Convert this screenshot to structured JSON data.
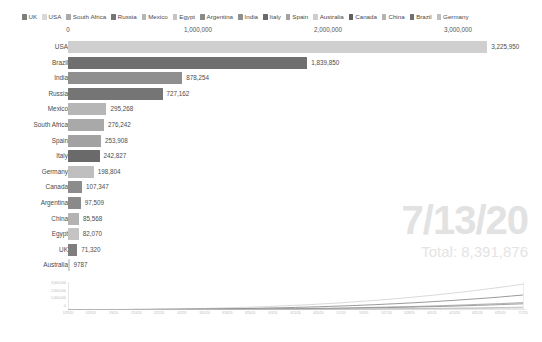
{
  "chart_data": {
    "type": "bar",
    "title": "",
    "subtitle": "",
    "xlabel": "",
    "ylabel": "",
    "orientation": "horizontal",
    "xlim": [
      0,
      3500000
    ],
    "grid": false,
    "axis_position": "top",
    "axis_ticks": [
      {
        "label": "0",
        "value": 0
      },
      {
        "label": "1,000,000",
        "value": 1000000
      },
      {
        "label": "2,000,000",
        "value": 2000000
      },
      {
        "label": "3,000,000",
        "value": 3000000
      }
    ],
    "categories": [
      "USA",
      "Brazil",
      "India",
      "Russia",
      "Mexico",
      "South Africa",
      "Spain",
      "Italy",
      "Germany",
      "Canada",
      "Argentina",
      "China",
      "Egypt",
      "UK",
      "Australia"
    ],
    "values": [
      3225950,
      1839850,
      878254,
      727162,
      295268,
      276242,
      253908,
      242827,
      198804,
      107347,
      97509,
      85568,
      82070,
      71320,
      9787
    ],
    "value_labels": [
      "3,225,950",
      "1,839,850",
      "878,254",
      "727,162",
      "295,268",
      "276,242",
      "253,908",
      "242,827",
      "198,804",
      "107,347",
      "97,509",
      "85,568",
      "82,070",
      "71,320",
      "9787"
    ],
    "bar_colors": [
      "#cfcfcf",
      "#6f6f6f",
      "#8f8f8f",
      "#757575",
      "#b6b6b6",
      "#a9a9a9",
      "#a2a2a2",
      "#6a6a6a",
      "#bfbfbf",
      "#8c8c8c",
      "#8a8a8a",
      "#b3b3b3",
      "#c4c4c4",
      "#7e7e7e",
      "#d2d2d2"
    ],
    "legend": {
      "position": "top",
      "entries": [
        {
          "label": "UK",
          "color": "#7e7e7e"
        },
        {
          "label": "USA",
          "color": "#d8d8d8"
        },
        {
          "label": "South Africa",
          "color": "#a9a9a9"
        },
        {
          "label": "Russia",
          "color": "#757575"
        },
        {
          "label": "Mexico",
          "color": "#b6b6b6"
        },
        {
          "label": "Egypt",
          "color": "#c4c4c4"
        },
        {
          "label": "Argentina",
          "color": "#8a8a8a"
        },
        {
          "label": "India",
          "color": "#8f8f8f"
        },
        {
          "label": "Italy",
          "color": "#6a6a6a"
        },
        {
          "label": "Spain",
          "color": "#a2a2a2"
        },
        {
          "label": "Australia",
          "color": "#cdcdcd"
        },
        {
          "label": "Canada",
          "color": "#5f5f5f"
        },
        {
          "label": "China",
          "color": "#b3b3b3"
        },
        {
          "label": "Brazil",
          "color": "#6f6f6f"
        },
        {
          "label": "Germany",
          "color": "#bfbfbf"
        }
      ]
    },
    "annotations": {
      "date": "7/13/20",
      "total": "Total: 8,391,876"
    },
    "inset_chart": {
      "type": "line",
      "title": "",
      "ylim": [
        0,
        3500000
      ],
      "y_ticks": [
        "3,000,000",
        "2,000,000",
        "1,000,000",
        "0"
      ],
      "x_ticks": [
        "1/29/20",
        "1/29/20",
        "2/6/20",
        "2/14/20",
        "2/22/20",
        "3/2/20",
        "3/10/20",
        "3/18/20",
        "3/26/20",
        "4/3/20",
        "4/11/20",
        "4/20/20",
        "5/1/20",
        "5/9/20",
        "5/17/20",
        "5/28/20",
        "6/5/20",
        "6/13/20",
        "6/25/20",
        "6/29/20",
        "7/7/20"
      ],
      "series": [
        {
          "name": "USA",
          "color": "#c9c9c9",
          "end": 3225950
        },
        {
          "name": "Brazil",
          "color": "#6f6f6f",
          "end": 1839850
        },
        {
          "name": "India",
          "color": "#8f8f8f",
          "end": 878254
        },
        {
          "name": "Russia",
          "color": "#7a7a7a",
          "end": 727162
        },
        {
          "name": "Mexico",
          "color": "#b0b0b0",
          "end": 295268
        },
        {
          "name": "Others",
          "color": "#bdbdbd",
          "end": 200000
        }
      ]
    }
  }
}
